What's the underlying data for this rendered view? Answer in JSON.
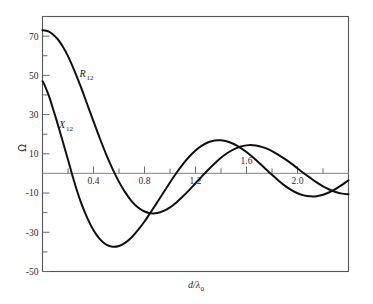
{
  "chart_data": {
    "type": "line",
    "title": "",
    "xlabel": "d/λ₀",
    "ylabel": "Ω",
    "xlim": [
      0,
      2.4
    ],
    "ylim": [
      -50,
      80
    ],
    "grid": false,
    "legend": "inline-curve-labels",
    "x_ticks_major": [
      "0.4",
      "0.8",
      "1.2",
      "1.6",
      "2.0"
    ],
    "x_tick_values_major": [
      0.4,
      0.8,
      1.2,
      1.6,
      2.0
    ],
    "x_tick_values_minor": [
      0.2,
      0.6,
      1.0,
      1.4,
      1.8,
      2.2
    ],
    "y_ticks_major": [
      "70",
      "50",
      "30",
      "10",
      "-10",
      "-30",
      "-50"
    ],
    "y_tick_values_major": [
      70,
      50,
      30,
      10,
      -10,
      -30,
      -50
    ],
    "y_tick_values_minor": [
      80,
      60,
      40,
      20,
      0,
      -20,
      -40
    ],
    "series": [
      {
        "name": "R₁₂",
        "label": "R",
        "label_sub": "12",
        "label_x": 0.29,
        "label_y": 49,
        "x": [
          0.0,
          0.02,
          0.05,
          0.08,
          0.12,
          0.16,
          0.2,
          0.25,
          0.3,
          0.35,
          0.4,
          0.45,
          0.5,
          0.55,
          0.6,
          0.65,
          0.7,
          0.75,
          0.8,
          0.85,
          0.9,
          0.95,
          1.0,
          1.05,
          1.1,
          1.15,
          1.2,
          1.25,
          1.3,
          1.35,
          1.4,
          1.45,
          1.5,
          1.55,
          1.6,
          1.65,
          1.7,
          1.75,
          1.8,
          1.85,
          1.9,
          1.95,
          2.0,
          2.05,
          2.1,
          2.15,
          2.2,
          2.25,
          2.3,
          2.35,
          2.4
        ],
        "y": [
          73.0,
          72.9,
          72.3,
          71.0,
          68.4,
          64.6,
          59.8,
          52.4,
          44.2,
          35.4,
          26.5,
          17.8,
          9.6,
          2.2,
          -4.3,
          -9.8,
          -14.2,
          -17.4,
          -19.4,
          -20.3,
          -20.2,
          -19.1,
          -17.3,
          -14.8,
          -11.8,
          -8.5,
          -5.0,
          -1.5,
          1.9,
          5.1,
          8.0,
          10.4,
          12.3,
          13.6,
          14.3,
          14.4,
          13.9,
          12.9,
          11.4,
          9.5,
          7.4,
          5.1,
          2.6,
          0.1,
          -2.3,
          -4.6,
          -6.6,
          -8.2,
          -9.5,
          -10.3,
          -10.6
        ]
      },
      {
        "name": "X₁₂",
        "label": "X",
        "label_sub": "12",
        "label_x": 0.13,
        "label_y": 23,
        "x": [
          0.0,
          0.02,
          0.05,
          0.08,
          0.12,
          0.16,
          0.2,
          0.25,
          0.3,
          0.35,
          0.4,
          0.45,
          0.5,
          0.55,
          0.6,
          0.65,
          0.7,
          0.75,
          0.8,
          0.85,
          0.9,
          0.95,
          1.0,
          1.05,
          1.1,
          1.15,
          1.2,
          1.25,
          1.3,
          1.35,
          1.4,
          1.45,
          1.5,
          1.55,
          1.6,
          1.65,
          1.7,
          1.75,
          1.8,
          1.85,
          1.9,
          1.95,
          2.0,
          2.05,
          2.1,
          2.15,
          2.2,
          2.25,
          2.3,
          2.35,
          2.4
        ],
        "y": [
          47.0,
          44.5,
          39.5,
          33.5,
          25.0,
          16.0,
          7.0,
          -4.5,
          -14.5,
          -22.5,
          -29.0,
          -33.5,
          -36.3,
          -37.4,
          -37.0,
          -35.3,
          -32.5,
          -28.8,
          -24.5,
          -19.7,
          -14.7,
          -9.6,
          -4.6,
          0.2,
          4.6,
          8.5,
          11.7,
          14.2,
          15.9,
          16.8,
          16.9,
          16.3,
          15.0,
          13.2,
          10.9,
          8.2,
          5.3,
          2.3,
          -0.7,
          -3.6,
          -6.2,
          -8.4,
          -10.1,
          -11.2,
          -11.7,
          -11.6,
          -10.9,
          -9.6,
          -7.9,
          -5.8,
          -3.5
        ]
      }
    ]
  },
  "axis_labels": {
    "x_title": "d/λ",
    "x_title_sub": "0",
    "y_title": "Ω"
  }
}
